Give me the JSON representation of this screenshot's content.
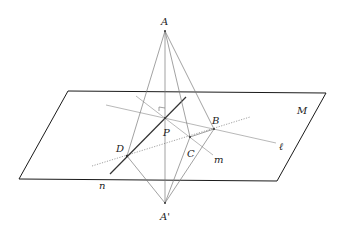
{
  "diagram": {
    "labels": {
      "A": "A",
      "A_prime": "A'",
      "B": "B",
      "C": "C",
      "D": "D",
      "P": "P",
      "M": "M",
      "l": "ℓ",
      "m": "m",
      "n": "n"
    },
    "points": {
      "A": [
        165,
        31
      ],
      "A_prime": [
        165,
        203
      ],
      "P": [
        165,
        118
      ],
      "B": [
        214,
        129
      ],
      "C": [
        190,
        137
      ],
      "D": [
        127,
        156
      ]
    },
    "plane": {
      "name": "M",
      "corners": [
        [
          68,
          91
        ],
        [
          326,
          93
        ],
        [
          277,
          181
        ],
        [
          19,
          179
        ]
      ]
    },
    "colors": {
      "plane_stroke": "#1a1a1a",
      "line": "#7a7a7a",
      "background": "#ffffff"
    }
  }
}
